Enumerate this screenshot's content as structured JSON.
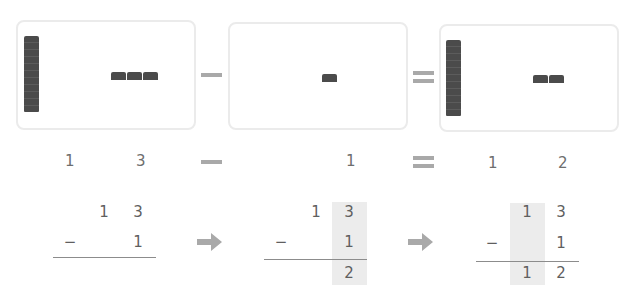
{
  "equation": {
    "minus_symbol": "−",
    "equals_symbol": "=",
    "row_labels": {
      "a_tens": "1",
      "a_ones": "3",
      "b_ones": "1",
      "result_tens": "1",
      "result_ones": "2"
    }
  },
  "panels": [
    {
      "name": "minuend",
      "tens_rods": 1,
      "unit_cubes": 3
    },
    {
      "name": "subtrahend",
      "tens_rods": 0,
      "unit_cubes": 1
    },
    {
      "name": "difference",
      "tens_rods": 1,
      "unit_cubes": 2
    }
  ],
  "vertical_steps": [
    {
      "top": [
        "1",
        "3"
      ],
      "op": "−",
      "bottom": [
        "",
        "1"
      ],
      "result": [
        "",
        ""
      ],
      "highlight": "none"
    },
    {
      "top": [
        "1",
        "3"
      ],
      "op": "−",
      "bottom": [
        "",
        "1"
      ],
      "result": [
        "",
        "2"
      ],
      "highlight": "ones"
    },
    {
      "top": [
        "1",
        "3"
      ],
      "op": "−",
      "bottom": [
        "",
        "1"
      ],
      "result": [
        "1",
        "2"
      ],
      "highlight": "tens"
    }
  ],
  "arrows": [
    "right-arrow",
    "right-arrow"
  ],
  "colors": {
    "block": "#4b4b4b",
    "operator": "#a9a9a9",
    "panel_border": "#ebebeb",
    "highlight": "#ececec",
    "text": "#6e6e6e"
  }
}
